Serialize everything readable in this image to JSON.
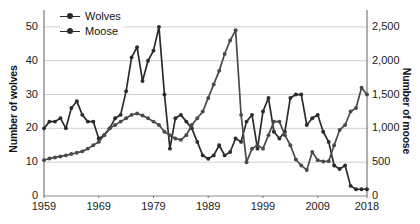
{
  "chart_data": {
    "type": "line",
    "title": "",
    "xlabel": "",
    "x_ticks": [
      "1959",
      "1969",
      "1979",
      "1989",
      "1999",
      "2009",
      "2018"
    ],
    "x_tick_values": [
      1959,
      1969,
      1979,
      1989,
      1999,
      2009,
      2018
    ],
    "xlim": [
      1959,
      2018
    ],
    "grid": true,
    "legend_position": "top-left",
    "axes": {
      "left": {
        "label": "Number of wolves",
        "ticks": [
          "0",
          "10",
          "20",
          "30",
          "40",
          "50"
        ],
        "tick_values": [
          0,
          10,
          20,
          30,
          40,
          50
        ],
        "ylim": [
          0,
          55
        ]
      },
      "right": {
        "label": "Number of moose",
        "ticks": [
          "0",
          "500",
          "1,000",
          "1,500",
          "2,000",
          "2,500"
        ],
        "tick_values": [
          0,
          500,
          1000,
          1500,
          2000,
          2500
        ],
        "ylim": [
          0,
          2750
        ]
      }
    },
    "series": [
      {
        "name": "Wolves",
        "axis": "left",
        "color": "#2b2b2b",
        "x": [
          1959,
          1960,
          1961,
          1962,
          1963,
          1964,
          1965,
          1966,
          1967,
          1968,
          1969,
          1970,
          1971,
          1972,
          1973,
          1974,
          1975,
          1976,
          1977,
          1978,
          1979,
          1980,
          1981,
          1982,
          1983,
          1984,
          1985,
          1986,
          1987,
          1988,
          1989,
          1990,
          1991,
          1992,
          1993,
          1994,
          1995,
          1996,
          1997,
          1998,
          1999,
          2000,
          2001,
          2002,
          2003,
          2004,
          2005,
          2006,
          2007,
          2008,
          2009,
          2010,
          2011,
          2012,
          2013,
          2014,
          2015,
          2016,
          2017,
          2018
        ],
        "values": [
          20,
          22,
          22,
          23,
          20,
          26,
          28,
          24,
          22,
          22,
          17,
          18,
          20,
          23,
          24,
          31,
          41,
          44,
          34,
          40,
          43,
          50,
          30,
          14,
          23,
          24,
          22,
          20,
          16,
          12,
          11,
          12,
          15,
          12,
          13,
          17,
          16,
          22,
          24,
          14,
          25,
          29,
          19,
          17,
          19,
          29,
          30,
          30,
          21,
          23,
          24,
          19,
          16,
          9,
          8,
          9,
          3,
          2,
          2,
          2
        ]
      },
      {
        "name": "Moose",
        "axis": "right",
        "color": "#4a4a4a",
        "x": [
          1959,
          1960,
          1961,
          1962,
          1963,
          1964,
          1965,
          1966,
          1967,
          1968,
          1969,
          1970,
          1971,
          1972,
          1973,
          1974,
          1975,
          1976,
          1977,
          1978,
          1979,
          1980,
          1981,
          1982,
          1983,
          1984,
          1985,
          1986,
          1987,
          1988,
          1989,
          1990,
          1991,
          1992,
          1993,
          1994,
          1995,
          1996,
          1997,
          1998,
          1999,
          2000,
          2001,
          2002,
          2003,
          2004,
          2005,
          2006,
          2007,
          2008,
          2009,
          2010,
          2011,
          2012,
          2013,
          2014,
          2015,
          2016,
          2017,
          2018
        ],
        "values": [
          530,
          555,
          570,
          585,
          600,
          620,
          640,
          660,
          700,
          750,
          800,
          900,
          1000,
          1050,
          1100,
          1150,
          1200,
          1220,
          1190,
          1150,
          1100,
          1050,
          950,
          900,
          850,
          830,
          900,
          1050,
          1150,
          1250,
          1450,
          1650,
          1850,
          2100,
          2300,
          2450,
          1200,
          500,
          700,
          750,
          700,
          900,
          1100,
          1100,
          900,
          750,
          540,
          450,
          385,
          650,
          530,
          510,
          515,
          750,
          975,
          1050,
          1250,
          1300,
          1600,
          1500
        ]
      }
    ]
  }
}
